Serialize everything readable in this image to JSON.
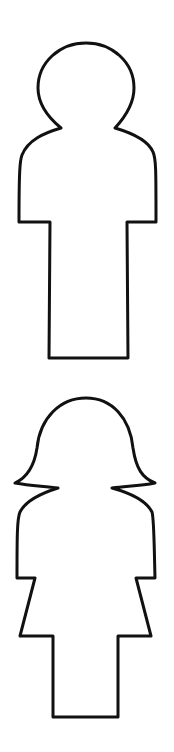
{
  "figures": [
    {
      "name": "male-figure",
      "description": "Outline of a male pictogram"
    },
    {
      "name": "female-figure",
      "description": "Outline of a female pictogram"
    }
  ],
  "colors": {
    "background": "#ffffff",
    "stroke": "#111111"
  }
}
